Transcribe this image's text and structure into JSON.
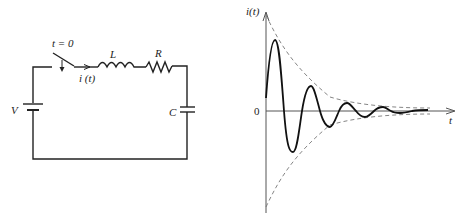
{
  "circuit": {
    "switch_label": "t = 0",
    "current_label": "i (t)",
    "inductor_label": "L",
    "resistor_label": "R",
    "source_label": "V",
    "capacitor_label": "C"
  },
  "graph": {
    "y_axis_label": "i(t)",
    "x_axis_label": "t",
    "origin_label": "0"
  },
  "colors": {
    "line": "#222222",
    "axis": "#555555",
    "envelope": "#777777",
    "background": "#ffffff"
  }
}
